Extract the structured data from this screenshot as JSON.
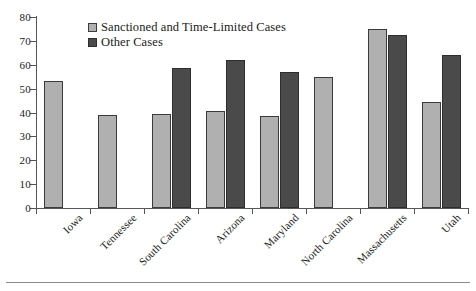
{
  "chart_data": {
    "type": "bar",
    "title": "",
    "xlabel": "",
    "ylabel": "",
    "ylim": [
      0,
      80
    ],
    "ytick_step": 10,
    "yticks": [
      0,
      10,
      20,
      30,
      40,
      50,
      60,
      70,
      80
    ],
    "ytick_labels": [
      "0",
      "10",
      "20",
      "30",
      "40",
      "50",
      "60",
      "70",
      "80"
    ],
    "grid": false,
    "legend_position": "top-left-inside",
    "categories": [
      "Iowa",
      "Tennessee",
      "South Carolina",
      "Arizona",
      "Maryland",
      "North Carolina",
      "Massachusetts",
      "Utah"
    ],
    "series": [
      {
        "name": "Sanctioned and Time-Limited Cases",
        "color": "#b0b0b0",
        "values": [
          53,
          39,
          39.5,
          40.5,
          38.5,
          55,
          75,
          44.5
        ]
      },
      {
        "name": "Other Cases",
        "color": "#4a4a4a",
        "values": [
          null,
          null,
          58.5,
          62,
          57,
          null,
          72.5,
          64
        ]
      }
    ]
  },
  "legend": {
    "items": [
      {
        "label": "Sanctioned and Time-Limited Cases",
        "swatch": "light"
      },
      {
        "label": "Other Cases",
        "swatch": "dark"
      }
    ]
  },
  "colors": {
    "series_light": "#b0b0b0",
    "series_dark": "#4a4a4a",
    "axis": "#555555",
    "rule": "#8a8a8a",
    "background": "#ffffff"
  }
}
